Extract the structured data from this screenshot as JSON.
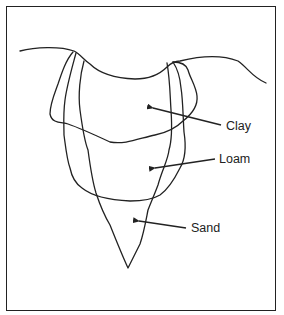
{
  "diagram": {
    "type": "soil-profile-cross-section",
    "labels": {
      "clay": "Clay",
      "loam": "Loam",
      "sand": "Sand"
    },
    "colors": {
      "stroke": "#222222",
      "background": "#ffffff"
    }
  }
}
